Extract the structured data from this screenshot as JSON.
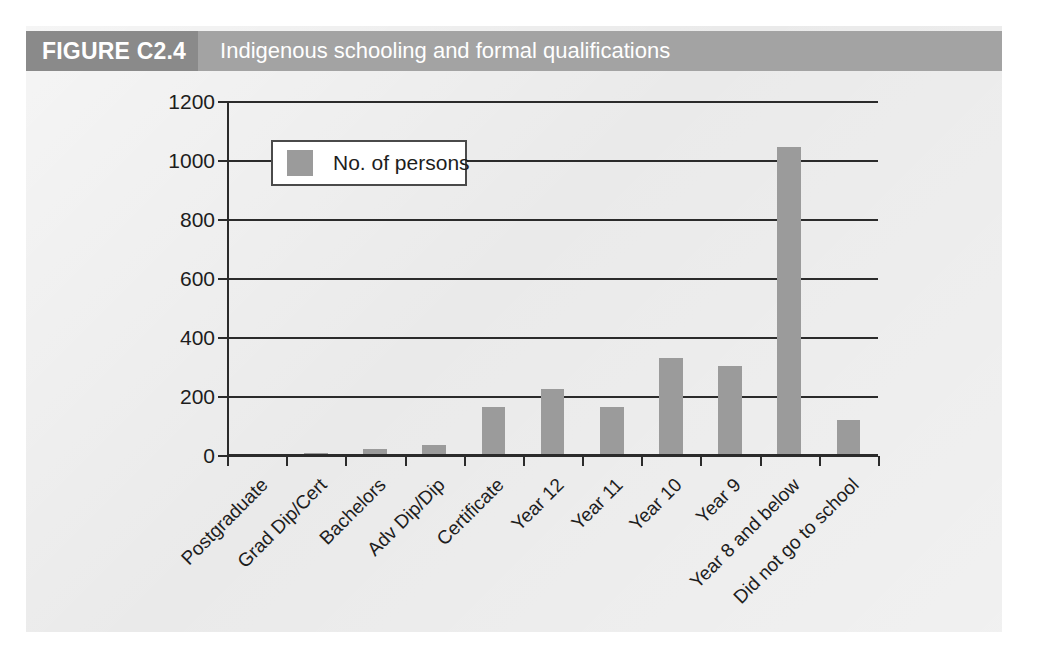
{
  "figure": {
    "tag": "FIGURE C2.4",
    "caption": "Indigenous schooling and formal qualifications"
  },
  "legend": {
    "label": "No. of persons",
    "swatch_color": "#9b9b9b"
  },
  "colors": {
    "banner": "#a3a3a3",
    "banner_tag": "#8a8a8a",
    "panel_background": "#e9e9e9",
    "bar": "#9b9b9b",
    "axis": "#2b2b2b",
    "text": "#1d1d1d"
  },
  "chart_data": {
    "type": "bar",
    "title": "Indigenous schooling and formal qualifications",
    "xlabel": "",
    "ylabel": "",
    "ylim": [
      0,
      1200
    ],
    "yticks": [
      0,
      200,
      400,
      600,
      800,
      1000,
      1200
    ],
    "ytick_labels": [
      "0",
      "200",
      "400",
      "600",
      "800",
      "1000",
      "1200"
    ],
    "grid": true,
    "legend_position": "upper-left-inside",
    "categories": [
      "Postgraduate",
      "Grad Dip/Cert",
      "Bachelors",
      "Adv Dip/Dip",
      "Certificate",
      "Year 12",
      "Year 11",
      "Year 10",
      "Year 9",
      "Year 8 and below",
      "Did not go to school"
    ],
    "series": [
      {
        "name": "No. of persons",
        "values": [
          0,
          3,
          18,
          32,
          160,
          220,
          160,
          325,
          300,
          1040,
          115
        ]
      }
    ]
  }
}
